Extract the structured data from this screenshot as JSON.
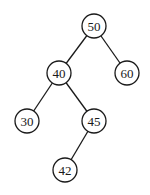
{
  "diagram": {
    "type": "binary-search-tree",
    "nodes": [
      {
        "id": "n50",
        "label": "50",
        "x": 94,
        "y": 26
      },
      {
        "id": "n40",
        "label": "40",
        "x": 59,
        "y": 73
      },
      {
        "id": "n60",
        "label": "60",
        "x": 127,
        "y": 73
      },
      {
        "id": "n30",
        "label": "30",
        "x": 27,
        "y": 121
      },
      {
        "id": "n45",
        "label": "45",
        "x": 94,
        "y": 121
      },
      {
        "id": "n42",
        "label": "42",
        "x": 65,
        "y": 170
      }
    ],
    "edges": [
      {
        "from": "50",
        "to": "40"
      },
      {
        "from": "50",
        "to": "60"
      },
      {
        "from": "40",
        "to": "30"
      },
      {
        "from": "40",
        "to": "45"
      },
      {
        "from": "45",
        "to": "42"
      }
    ]
  }
}
